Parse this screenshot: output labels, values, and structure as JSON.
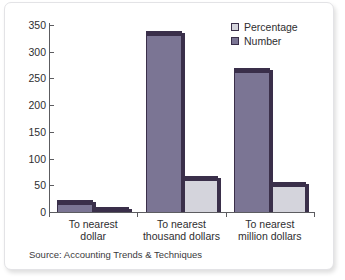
{
  "chart_data": {
    "type": "bar",
    "title": "",
    "subtitle": "",
    "xlabel": "",
    "ylabel": "",
    "ylim": [
      0,
      350
    ],
    "yticks": [
      0,
      50,
      100,
      150,
      200,
      250,
      300,
      350
    ],
    "ytick_labels": [
      "0",
      "50",
      "100",
      "150",
      "200",
      "250",
      "300",
      "350"
    ],
    "grid": false,
    "legend_position": "top-right",
    "categories": [
      "To nearest dollar",
      "To nearest thousand dollars",
      "To nearest million dollars"
    ],
    "category_lines": [
      [
        "To nearest",
        "dollar"
      ],
      [
        "To nearest",
        "thousand dollars"
      ],
      [
        "To nearest",
        "million dollars"
      ]
    ],
    "series": [
      {
        "name": "Number",
        "values": [
          15,
          332,
          262
        ],
        "color": "#7b7594"
      },
      {
        "name": "Percentage",
        "values": [
          2,
          60,
          48
        ],
        "color": "#d4d4dc"
      }
    ],
    "source": "Source: Accounting Trends & Techniques"
  },
  "legend": {
    "items": [
      {
        "label": "Percentage",
        "swatch": "light"
      },
      {
        "label": "Number",
        "swatch": "dark"
      }
    ]
  },
  "colors": {
    "bar_dark": "#7b7594",
    "bar_light": "#d4d4dc",
    "bar_outline": "#3a2f4a",
    "axis": "#5c5c60",
    "text": "#2e2e30",
    "background": "#ffffff",
    "frame_border": "#e3e3e6"
  }
}
